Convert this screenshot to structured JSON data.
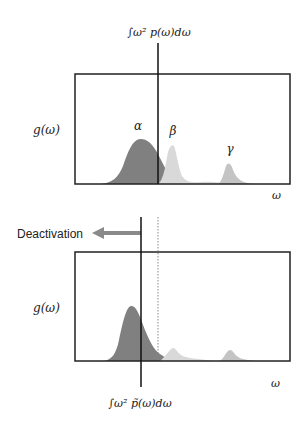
{
  "top_panel": {
    "integral_label": "∫ω² p(ω)dω",
    "y_label": "g(ω)",
    "x_label": "ω",
    "peaks": [
      {
        "name": "alpha",
        "label": "α",
        "color": "#808080"
      },
      {
        "name": "beta",
        "label": "β",
        "color": "#d9d9d9"
      },
      {
        "name": "gamma",
        "label": "γ",
        "color": "#c4c4c4"
      }
    ]
  },
  "arrow": {
    "label": "Deactivation",
    "color": "#8a8a8a"
  },
  "bottom_panel": {
    "integral_label": "∫ω² p̃(ω)dω",
    "y_label": "g(ω)",
    "x_label": "ω"
  },
  "colors": {
    "axis": "#222222",
    "alpha": "#808080",
    "beta": "#d9d9d9",
    "gamma": "#c4c4c4",
    "arrow": "#8a8a8a"
  }
}
